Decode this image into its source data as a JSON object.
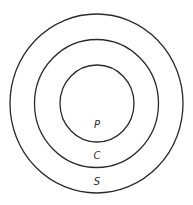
{
  "diagram": {
    "type": "concentric-circles",
    "rings": [
      {
        "label": "S",
        "name": "outer",
        "cx": 96.5,
        "cy": 103.5,
        "rx": 86.5,
        "ry": 89.5
      },
      {
        "label": "C",
        "name": "middle",
        "cx": 96.5,
        "cy": 103.5,
        "rx": 62,
        "ry": 64
      },
      {
        "label": "P",
        "name": "inner",
        "cx": 97,
        "cy": 103.5,
        "rx": 37,
        "ry": 38.5
      }
    ],
    "labels": {
      "inner": "P",
      "middle": "C",
      "outer": "S"
    },
    "stroke_color": "#2a2a2a",
    "background": "#ffffff"
  }
}
